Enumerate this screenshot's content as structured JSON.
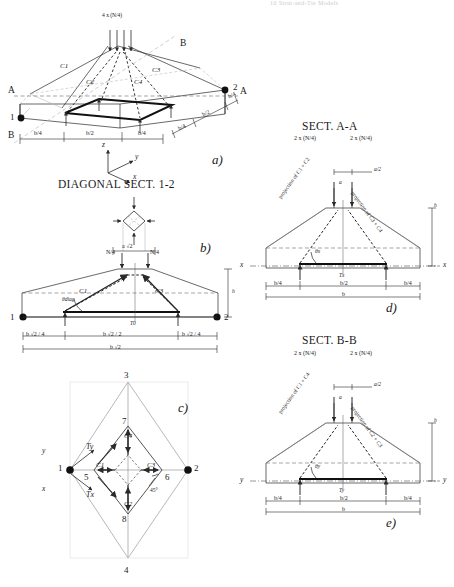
{
  "page": {
    "header_note": "10   Strut-and-Tie Models",
    "width": 454,
    "height": 587,
    "background": "#ffffff",
    "ink": "#1a1a1a"
  },
  "panels": [
    {
      "id": "a",
      "letter": "a)",
      "title": "",
      "type": "3d-pyramid-pile-cap",
      "labels": {
        "load": "4 x (N/4)",
        "struts": [
          "C1",
          "C2",
          "C3",
          "C4"
        ],
        "nodes": [
          "1",
          "2"
        ],
        "section_marks": [
          "A",
          "A",
          "B",
          "B"
        ],
        "dimensions_bottom": [
          "b/4",
          "b/2",
          "b/4"
        ],
        "dimensions_right": [
          "b/4",
          "b/2",
          "b/4"
        ],
        "axes": [
          "z",
          "y",
          "x"
        ]
      }
    },
    {
      "id": "b",
      "letter": "b)",
      "title": "DIAGONAL SECT. 1-2",
      "type": "diagonal-section",
      "labels": {
        "inset_dim": "a √2",
        "loads": [
          "N/4",
          "N/4"
        ],
        "struts": [
          "C1",
          "C3"
        ],
        "nodes": [
          "1",
          "2"
        ],
        "angle": "θdiag",
        "height": "h",
        "tie": "T0",
        "dimensions": [
          "b √2 / 4",
          "b √2 / 2",
          "b √2 / 4"
        ],
        "total": "b √2"
      }
    },
    {
      "id": "c",
      "letter": "c)",
      "title": "",
      "type": "plan-node-layout",
      "labels": {
        "outer_nodes": [
          "1",
          "2",
          "3",
          "4"
        ],
        "inner_nodes": [
          "5",
          "6",
          "7",
          "8"
        ],
        "struts": [
          "C1",
          "C2",
          "C3",
          "C4"
        ],
        "ties": [
          "Tx",
          "Ty"
        ],
        "angle": "45°",
        "axes": [
          "x",
          "y"
        ]
      }
    },
    {
      "id": "d",
      "letter": "d)",
      "title": "SECT. A-A",
      "type": "orthogonal-section",
      "labels": {
        "loads": [
          "2 x (N/4)",
          "2 x (N/4)"
        ],
        "top_dim": "a/2",
        "col_dim": "a",
        "projection_left": "projection of C1 + C2",
        "projection_right": "projection of C3 + C4",
        "angle": "θx",
        "height": "h",
        "tie": "Tx",
        "axis_left": "x",
        "axis_right": "x",
        "dimensions": [
          "b/4",
          "b/2",
          "b/4"
        ],
        "total": "b"
      }
    },
    {
      "id": "e",
      "letter": "e)",
      "title": "SECT. B-B",
      "type": "orthogonal-section",
      "labels": {
        "loads": [
          "2 x (N/4)",
          "2 x (N/4)"
        ],
        "top_dim": "a/2",
        "col_dim": "a",
        "projection_left": "projection of C1 + C4",
        "projection_right": "projection of C2 + C3",
        "angle": "θy",
        "height": "h",
        "tie": "Ty",
        "axis_left": "y",
        "axis_right": "y",
        "dimensions": [
          "b/4",
          "b/2",
          "b/4"
        ],
        "total": "b"
      }
    }
  ],
  "style_colors": {
    "line": "#2a2a2a",
    "faint": "#9a9aa2",
    "dashed": "#333333"
  }
}
